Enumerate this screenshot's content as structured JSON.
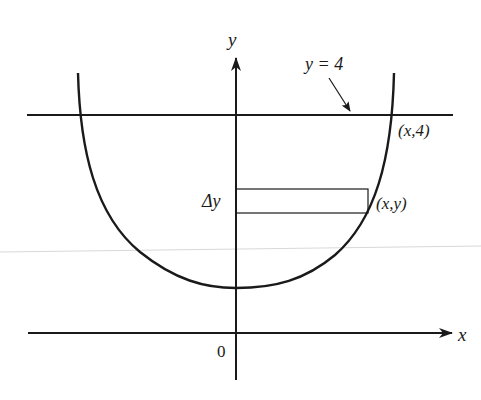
{
  "figure": {
    "colors": {
      "ink": "#1a1a1a",
      "background": "#ffffff",
      "artifact": "#d8d8d8"
    },
    "axes": {
      "x_label": "x",
      "y_label": "y",
      "origin_label": "0"
    },
    "line": {
      "label": "y = 4",
      "equation_value": 4
    },
    "points": {
      "upper": "(x,4)",
      "strip": "(x,y)"
    },
    "strip": {
      "thickness_label": "Δy"
    }
  }
}
